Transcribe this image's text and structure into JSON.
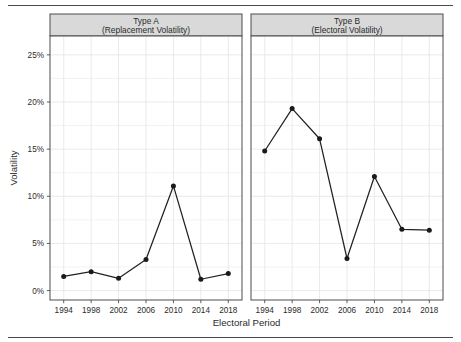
{
  "chart_data": {
    "type": "line",
    "title": "",
    "xlabel": "Electoral Period",
    "ylabel": "Volatility",
    "x": [
      1994,
      1998,
      2002,
      2006,
      2010,
      2014,
      2018
    ],
    "xticklabels": [
      "1994",
      "1998",
      "2002",
      "2006",
      "2010",
      "2014",
      "2018"
    ],
    "yticks": [
      0,
      5,
      10,
      15,
      20,
      25
    ],
    "yticklabels": [
      "0%",
      "5%",
      "10%",
      "15%",
      "20%",
      "25%"
    ],
    "ylim": [
      -1.0,
      27.0
    ],
    "xlim": [
      1992.0,
      2020.0
    ],
    "grid": true,
    "legend": "none",
    "facets": [
      {
        "strip_line1": "Type A",
        "strip_line2": "(Replacement Volatility)",
        "series": [
          {
            "name": "Replacement Volatility",
            "values": [
              1.5,
              2.0,
              1.3,
              3.3,
              11.1,
              1.2,
              1.8
            ]
          }
        ]
      },
      {
        "strip_line1": "Type B",
        "strip_line2": "(Electoral Volatility)",
        "series": [
          {
            "name": "Electoral Volatility",
            "values": [
              14.8,
              19.3,
              16.1,
              3.4,
              12.1,
              6.5,
              6.4
            ]
          }
        ]
      }
    ],
    "colors": {
      "line": "#222222",
      "point": "#1a1a1a",
      "grid": "#ededed",
      "strip_background": "#d9d9d9",
      "panel_border": "#4d4d4d",
      "text": "#2b2b2b",
      "background": "#ffffff"
    }
  }
}
